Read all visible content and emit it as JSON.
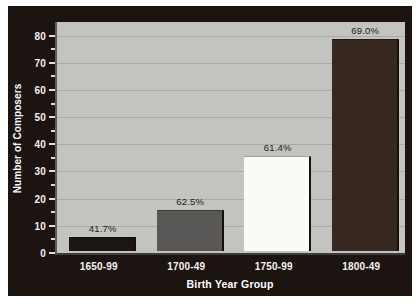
{
  "chart_data": {
    "type": "bar",
    "title": "",
    "xlabel": "Birth Year Group",
    "ylabel": "Number of Composers",
    "categories": [
      "1650-99",
      "1700-49",
      "1750-99",
      "1800-49"
    ],
    "values": [
      5,
      15,
      35,
      78
    ],
    "data_labels": [
      "41.7%",
      "62.5%",
      "61.4%",
      "69.0%"
    ],
    "bar_colors": [
      "#1d1512",
      "#5a5856",
      "#fafaf7",
      "#36271f"
    ],
    "ylim": [
      0,
      85
    ],
    "yticks_major": [
      0,
      10,
      20,
      30,
      40,
      50,
      60,
      70,
      80
    ],
    "yticks_major_labels": [
      "0",
      "10",
      "20",
      "30",
      "40",
      "50",
      "60",
      "70",
      "80"
    ],
    "yticks_minor": [
      5,
      15,
      25,
      35,
      45,
      55,
      65,
      75
    ],
    "grid": "horizontal",
    "legend": "none",
    "plot_background": "#c3c3c0",
    "frame_background": "#1b1411",
    "axis_text_color": "#f2f0ec"
  }
}
